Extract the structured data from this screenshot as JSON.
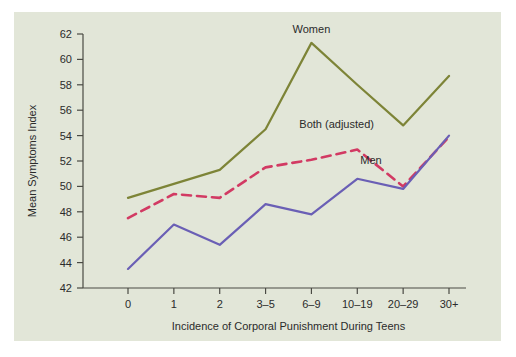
{
  "chart_data": {
    "type": "line",
    "title": "",
    "subtitle": "",
    "xlabel": "Incidence of Corporal Punishment During Teens",
    "ylabel": "Mean Symptoms Index",
    "categories": [
      "0",
      "1",
      "2",
      "3–5",
      "6–9",
      "10–19",
      "20–29",
      "30+"
    ],
    "ylim": [
      42,
      62
    ],
    "yticks": [
      42,
      44,
      46,
      48,
      50,
      52,
      54,
      56,
      58,
      60,
      62
    ],
    "grid": false,
    "legend_position": "inline-annotations",
    "series": [
      {
        "name": "Women",
        "color": "#7d8437",
        "style": "solid",
        "values": [
          49.1,
          50.2,
          51.3,
          54.5,
          61.3,
          58.0,
          54.8,
          58.7
        ]
      },
      {
        "name": "Both (adjusted)",
        "color": "#d23a63",
        "style": "dashed",
        "values": [
          47.5,
          49.4,
          49.1,
          51.5,
          52.1,
          52.9,
          50.0,
          53.9
        ]
      },
      {
        "name": "Men",
        "color": "#6a5fb5",
        "style": "solid",
        "values": [
          43.5,
          47.0,
          45.4,
          48.6,
          47.8,
          50.6,
          49.8,
          54.0
        ]
      }
    ],
    "annotations": [
      {
        "text": "Women",
        "x": 4,
        "y": 62.1,
        "anchor": "middle"
      },
      {
        "text": "Both (adjusted)",
        "x": 4.55,
        "y": 54.6,
        "anchor": "middle"
      },
      {
        "text": "Men",
        "x": 5.3,
        "y": 51.8,
        "anchor": "middle"
      }
    ]
  },
  "figure": {
    "background_color": "#ffffff",
    "panel_color": "#e2e6d8",
    "axis_color": "#4a4a44",
    "text_color": "#2b2b2b"
  }
}
